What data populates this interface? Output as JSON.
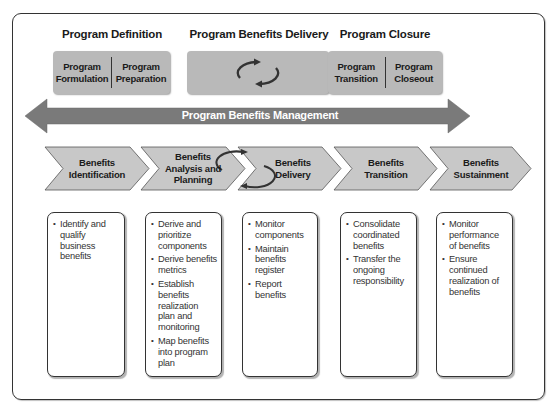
{
  "phases": [
    {
      "title": "Program Definition",
      "parts": [
        "Program Formulation",
        "Program Preparation"
      ]
    },
    {
      "title": "Program Benefits Delivery",
      "icon": "cycle-arrows-icon"
    },
    {
      "title": "Program Closure",
      "parts": [
        "Program Transition",
        "Program Closeout"
      ]
    }
  ],
  "management_arrow": {
    "label": "Program Benefits Management"
  },
  "stages": [
    {
      "label": "Benefits Identification",
      "items": [
        "Identify and qualify business benefits"
      ]
    },
    {
      "label": "Benefits Analysis and Planning",
      "items": [
        "Derive and prioritize components",
        "Derive benefits metrics",
        "Establish benefits realization plan and monitoring",
        "Map benefits into program plan"
      ]
    },
    {
      "label": "Benefits Delivery",
      "items": [
        "Monitor components",
        "Maintain benefits register",
        "Report benefits"
      ]
    },
    {
      "label": "Benefits Transition",
      "items": [
        "Consolidate coordinated benefits",
        "Transfer the ongoing responsibility"
      ]
    },
    {
      "label": "Benefits Sustainment",
      "items": [
        "Monitor performance of benefits",
        "Ensure continued realization of benefits"
      ]
    }
  ],
  "colors": {
    "box_gray": "#b9b9b9",
    "arrow_gray": "#7a7a7a",
    "chevron_gray": "#c8c8c8",
    "border": "#333333"
  }
}
